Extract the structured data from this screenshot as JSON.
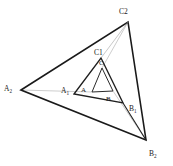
{
  "figure": {
    "kind": "geometry-diagram",
    "width": 173,
    "height": 166,
    "background_color": "#ffffff",
    "stroke_colors": {
      "outer_triangle": "#1a1a1a",
      "middle_triangle": "#1f1f1f",
      "inner_triangle": "#2a2a2a",
      "connector_lines": "#9a9a9a"
    },
    "stroke_widths": {
      "outer_triangle": 1.6,
      "middle_triangle": 1.3,
      "inner_triangle": 1.0,
      "connector_lines": 0.5
    }
  },
  "labels": {
    "outer": {
      "a": {
        "text": "A",
        "sub": "2"
      },
      "b": {
        "text": "B",
        "sub": "2"
      },
      "c": {
        "text": "C2",
        "sub": ""
      }
    },
    "middle": {
      "a": {
        "text": "A",
        "sub": "1"
      },
      "b": {
        "text": "B",
        "sub": "1"
      },
      "c": {
        "text": "C1",
        "sub": ""
      }
    },
    "inner": {
      "a": {
        "text": "A",
        "sub": ""
      },
      "b": {
        "text": "B",
        "sub": ""
      },
      "c": {
        "text": "C",
        "sub": ""
      }
    }
  },
  "geometry": {
    "outer_triangle": {
      "name": "triangle-A2-B2-C2",
      "points": "21,90 128,22 146,140",
      "vertices": {
        "A2": {
          "x": 21,
          "y": 90
        },
        "B2": {
          "x": 146,
          "y": 140
        },
        "C2": {
          "x": 128,
          "y": 22
        }
      }
    },
    "middle_triangle": {
      "name": "triangle-A1-B1-C1",
      "points": "74,94 101,58 123,103",
      "vertices": {
        "A1": {
          "x": 74,
          "y": 94
        },
        "B1": {
          "x": 123,
          "y": 103
        },
        "C1": {
          "x": 101,
          "y": 58
        }
      }
    },
    "inner_triangle": {
      "name": "triangle-A-B-C",
      "points": "92,92 102,68 113,91",
      "vertices": {
        "A": {
          "x": 92,
          "y": 92
        },
        "B": {
          "x": 113,
          "y": 91
        },
        "C": {
          "x": 102,
          "y": 68
        }
      }
    },
    "connectors": [
      {
        "name": "connector-A2-to-A",
        "x1": 21,
        "y1": 90,
        "x2": 92,
        "y2": 92
      },
      {
        "name": "connector-C2-to-C",
        "x1": 128,
        "y1": 22,
        "x2": 102,
        "y2": 68
      },
      {
        "name": "connector-B2-to-B",
        "x1": 146,
        "y1": 140,
        "x2": 113,
        "y2": 91
      },
      {
        "name": "connector-B2-to-B1",
        "x1": 146,
        "y1": 140,
        "x2": 123,
        "y2": 103
      },
      {
        "name": "connector-C2-to-C1",
        "x1": 128,
        "y1": 22,
        "x2": 101,
        "y2": 58
      }
    ]
  },
  "label_positions": {
    "A2": {
      "left": 4,
      "top": 85
    },
    "B2": {
      "left": 149,
      "top": 150
    },
    "C2": {
      "left": 119,
      "top": 8
    },
    "A1": {
      "left": 61,
      "top": 87
    },
    "B1": {
      "left": 129,
      "top": 105
    },
    "C1": {
      "left": 94,
      "top": 49
    },
    "A": {
      "left": 81,
      "top": 87
    },
    "B": {
      "left": 106,
      "top": 96
    },
    "C": {
      "left": 99,
      "top": 60
    }
  }
}
